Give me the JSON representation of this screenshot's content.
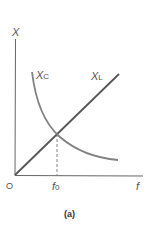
{
  "figure": {
    "caption": "(a)",
    "y_axis_label": "X",
    "x_axis_label": "f",
    "origin_label": "O",
    "marker_label": "f",
    "marker_sub": "0",
    "curves": [
      {
        "name": "X",
        "sub": "C",
        "description": "capacitive reactance, decreasing hyperbola"
      },
      {
        "name": "X",
        "sub": "L",
        "description": "inductive reactance, straight line through origin"
      }
    ],
    "colors": {
      "axis": "#555555",
      "xl_line": "#555555",
      "xc_curve": "#7a7a7a"
    }
  }
}
